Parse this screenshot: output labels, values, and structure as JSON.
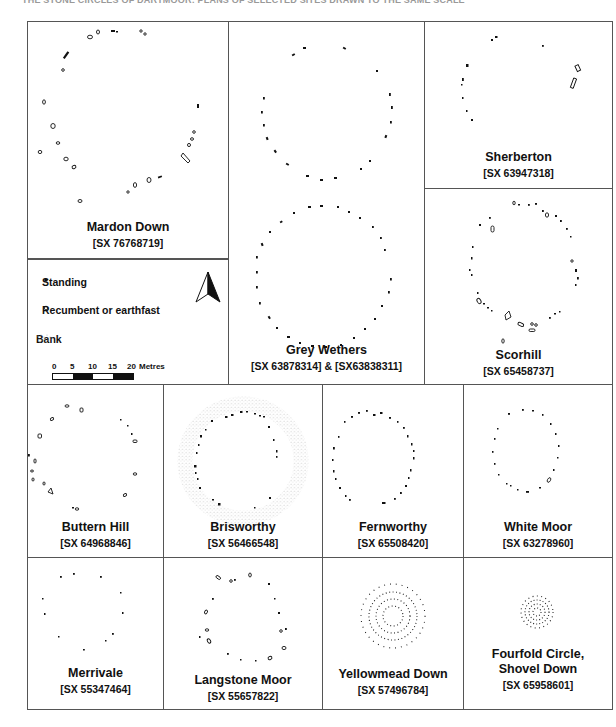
{
  "header": {
    "caption_cut": "THE STONE CIRCLES OF DARTMOOR: PLANS OF SELECTED SITES DRAWN TO THE SAME SCALE"
  },
  "legend": {
    "items": [
      {
        "symbol": "standing-stone",
        "label": "Standing"
      },
      {
        "symbol": "recumbent-stone",
        "label": "Recumbent or earthfast"
      },
      {
        "symbol": "bank-stipple",
        "label": "Bank"
      }
    ],
    "scale": {
      "ticks": [
        "0",
        "5",
        "10",
        "15",
        "20"
      ],
      "unit": "Metres"
    },
    "north_arrow": "north-arrow-icon"
  },
  "sites": [
    {
      "id": "mardon-down",
      "name": "Mardon Down",
      "grid_ref": "[SX 76768719]"
    },
    {
      "id": "grey-wethers",
      "name": "Grey Wethers",
      "grid_ref": "[SX 63878314] &  [SX63838311]"
    },
    {
      "id": "sherberton",
      "name": "Sherberton",
      "grid_ref": "[SX 63947318]"
    },
    {
      "id": "scorhill",
      "name": "Scorhill",
      "grid_ref": "[SX 65458737]"
    },
    {
      "id": "buttern-hill",
      "name": "Buttern Hill",
      "grid_ref": "[SX 64968846]"
    },
    {
      "id": "brisworthy",
      "name": "Brisworthy",
      "grid_ref": "[SX 56466548]"
    },
    {
      "id": "fernworthy",
      "name": "Fernworthy",
      "grid_ref": "[SX 65508420]"
    },
    {
      "id": "white-moor",
      "name": "White Moor",
      "grid_ref": "[SX 63278960]"
    },
    {
      "id": "merrivale",
      "name": "Merrivale",
      "grid_ref": "[SX 55347464]"
    },
    {
      "id": "langstone-moor",
      "name": "Langstone Moor",
      "grid_ref": "[SX 55657822]"
    },
    {
      "id": "yellowmead-down",
      "name": "Yellowmead Down",
      "grid_ref": "[SX 57496784]"
    },
    {
      "id": "fourfold-circle",
      "name": "Fourfold Circle,",
      "name_line2": "Shovel Down",
      "grid_ref": "[SX 65958601]"
    }
  ],
  "colors": {
    "ink": "#111111",
    "border": "#444444",
    "stipple": "#b0b0b0",
    "background": "#ffffff"
  }
}
